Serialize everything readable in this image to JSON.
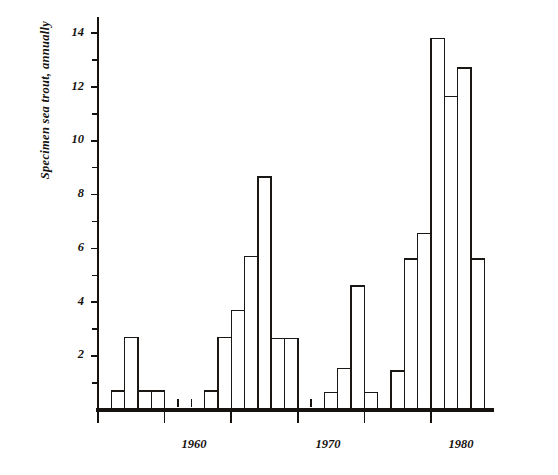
{
  "chart_data": {
    "type": "bar",
    "title": "",
    "xlabel": "",
    "ylabel": "Specimen sea trout, annually",
    "xlim": [
      1955.0,
      1984.0
    ],
    "ylim": [
      0,
      14.6
    ],
    "grid": false,
    "legend": null,
    "y_ticks_major": [
      2,
      4,
      6,
      8,
      10,
      12,
      14
    ],
    "y_ticks_minor": [
      1,
      3,
      5,
      7,
      9,
      11,
      13
    ],
    "x_ticks_major": [
      1955,
      1960,
      1965,
      1970,
      1975,
      1980
    ],
    "x_tick_labels": [
      "",
      "1960",
      "",
      "1970",
      "",
      "1980"
    ],
    "x_ticks_minor_every": 1,
    "categories": [
      1956,
      1957,
      1958,
      1959,
      1960,
      1961,
      1962,
      1963,
      1964,
      1965,
      1966,
      1967,
      1968,
      1969,
      1970,
      1971,
      1972,
      1973,
      1974,
      1975,
      1976,
      1977,
      1978,
      1979,
      1980,
      1981,
      1982,
      1983
    ],
    "values": [
      0.7,
      2.7,
      0.7,
      0.7,
      0,
      0,
      0,
      0.7,
      2.7,
      3.7,
      5.7,
      8.65,
      2.65,
      2.65,
      0,
      0,
      0.65,
      1.55,
      4.6,
      0.65,
      0,
      1.45,
      5.6,
      6.55,
      13.8,
      11.65,
      12.7,
      5.6
    ],
    "series": [
      {
        "name": "Specimen sea trout, annually",
        "values": [
          0.7,
          2.7,
          0.7,
          0.7,
          0,
          0,
          0,
          0.7,
          2.7,
          3.7,
          5.7,
          8.65,
          2.65,
          2.65,
          0,
          0,
          0.65,
          1.55,
          4.6,
          0.65,
          0,
          1.45,
          5.6,
          6.55,
          13.8,
          11.65,
          12.7,
          5.6
        ]
      }
    ],
    "bar_style": {
      "fill": "#ffffff",
      "edge": "#1a1715",
      "edge_width": 1.4,
      "bar_width_years": 1.0
    },
    "axis_color": "#15120f",
    "background": "#ffffff",
    "annotations": []
  },
  "axis": {
    "y_labels": [
      "14",
      "12",
      "10",
      "8",
      "6",
      "4",
      "2"
    ],
    "x_labels": [
      "1960",
      "1970",
      "1980"
    ],
    "y_title": "Specimen sea trout, annually"
  }
}
